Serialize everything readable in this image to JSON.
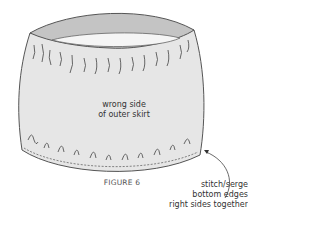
{
  "figure": {
    "caption": "FIGURE 6",
    "center_label": [
      "wrong side",
      "of outer skirt"
    ],
    "annotation": [
      "stitch/serge",
      "bottom edges",
      "right sides together"
    ]
  },
  "colors": {
    "body_fill": "#e6e6e6",
    "band_fill": "#c4c4c4",
    "inner_fill": "#f5f5f5",
    "stroke": "#444444"
  }
}
